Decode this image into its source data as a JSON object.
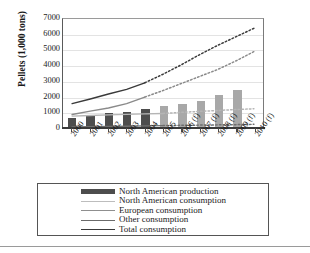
{
  "chart_data": {
    "type": "bar",
    "title": "",
    "xlabel": "",
    "ylabel": "Pellets (1,000 tons)",
    "ylim": [
      0,
      7000
    ],
    "yticks": [
      0,
      1000,
      2000,
      3000,
      4000,
      5000,
      6000,
      7000
    ],
    "grid": true,
    "legend_position": "bottom",
    "categories": [
      "2000",
      "2001",
      "2002",
      "2003",
      "2004",
      "2005",
      "2006 (f)",
      "2007 (f)",
      "2008 (f)",
      "2009 (f)",
      "2010 (f)"
    ],
    "series": [
      {
        "name": "North American production",
        "type": "bar",
        "values": [
          620,
          740,
          980,
          1040,
          1220,
          1400,
          1520,
          1710,
          2070,
          2400,
          2690
        ],
        "color": "#4d4d4d",
        "forecast_color": "#a8a8a8",
        "forecast_from": "2005"
      },
      {
        "name": "North American consumption",
        "type": "line",
        "values": [
          760,
          800,
          840,
          870,
          900,
          930,
          1000,
          1060,
          1120,
          1180,
          1230
        ],
        "color": "#b5b5b5",
        "forecast_from": "2005"
      },
      {
        "name": "European consumption",
        "type": "line",
        "values": [
          860,
          1080,
          1280,
          1560,
          1980,
          2400,
          2850,
          3300,
          3750,
          4300,
          4900
        ],
        "color": "#8a8a8a",
        "forecast_from": "2004"
      },
      {
        "name": "Other consumption",
        "type": "line",
        "values": [
          60,
          80,
          95,
          110,
          130,
          150,
          165,
          180,
          195,
          210,
          230
        ],
        "color": "#6e6e6e",
        "forecast_from": "2005"
      },
      {
        "name": "Total consumption",
        "type": "line",
        "values": [
          1560,
          1860,
          2180,
          2480,
          2900,
          3450,
          4050,
          4700,
          5300,
          5850,
          6400
        ],
        "color": "#3a3a3a",
        "forecast_from": "2004"
      }
    ],
    "legend": [
      {
        "label": "North American production",
        "marker": "block",
        "color": "#4d4d4d"
      },
      {
        "label": "North American consumption",
        "marker": "line",
        "color": "#bdbdbd"
      },
      {
        "label": "European consumption",
        "marker": "line",
        "color": "#8f8f8f"
      },
      {
        "label": "Other consumption",
        "marker": "line",
        "color": "#6a6a6a"
      },
      {
        "label": "Total consumption",
        "marker": "line",
        "color": "#3a3a3a"
      }
    ]
  }
}
